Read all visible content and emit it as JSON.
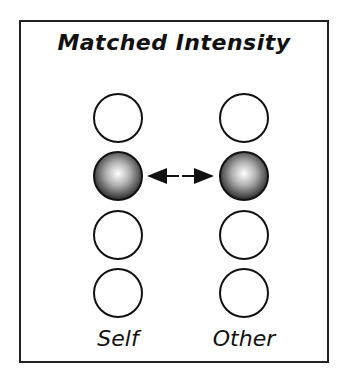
{
  "title": "Matched Intensity",
  "columns": [
    {
      "label": "Self",
      "center_x": 118,
      "filled_index": 1
    },
    {
      "label": "Other",
      "center_x": 244,
      "filled_index": 1
    }
  ],
  "circle_rows_y": [
    118,
    176,
    235,
    293
  ],
  "circle_radius": 24,
  "connector": {
    "type": "double-arrow",
    "from": "Self",
    "to": "Other",
    "row_index": 1
  },
  "colors": {
    "stroke": "#111111",
    "fill_light": "#ffffff",
    "fill_dark": "#333333"
  }
}
